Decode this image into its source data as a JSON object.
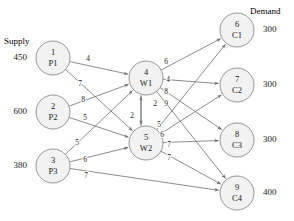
{
  "headings": {
    "supply": "Supply",
    "demand": "Demand"
  },
  "chart_data": {
    "type": "diagram",
    "title": "",
    "subtitle": "",
    "diagram_kind": "transshipment-network",
    "layers": [
      "supply",
      "transshipment",
      "demand"
    ],
    "nodes": [
      {
        "id": 1,
        "index": "1",
        "name": "P1",
        "layer": "supply",
        "x": 53,
        "y": 58,
        "r": 17,
        "value": "450",
        "value_kind": "supply"
      },
      {
        "id": 2,
        "index": "2",
        "name": "P2",
        "layer": "supply",
        "x": 53,
        "y": 112,
        "r": 17,
        "value": "600",
        "value_kind": "supply"
      },
      {
        "id": 3,
        "index": "3",
        "name": "P3",
        "layer": "supply",
        "x": 53,
        "y": 166,
        "r": 17,
        "value": "380",
        "value_kind": "supply"
      },
      {
        "id": 4,
        "index": "4",
        "name": "W1",
        "layer": "transshipment",
        "x": 146,
        "y": 78,
        "r": 17,
        "value": "",
        "value_kind": ""
      },
      {
        "id": 5,
        "index": "5",
        "name": "W2",
        "layer": "transshipment",
        "x": 146,
        "y": 143,
        "r": 17,
        "value": "",
        "value_kind": ""
      },
      {
        "id": 6,
        "index": "6",
        "name": "C1",
        "layer": "demand",
        "x": 237,
        "y": 30,
        "r": 17,
        "value": "300",
        "value_kind": "demand"
      },
      {
        "id": 7,
        "index": "7",
        "name": "C2",
        "layer": "demand",
        "x": 237,
        "y": 85,
        "r": 17,
        "value": "300",
        "value_kind": "demand"
      },
      {
        "id": 8,
        "index": "8",
        "name": "C3",
        "layer": "demand",
        "x": 237,
        "y": 140,
        "r": 17,
        "value": "300",
        "value_kind": "demand"
      },
      {
        "id": 9,
        "index": "9",
        "name": "C4",
        "layer": "demand",
        "x": 237,
        "y": 193,
        "r": 17,
        "value": "400",
        "value_kind": "demand"
      }
    ],
    "edges": [
      {
        "from": 1,
        "to": 4,
        "cost": "4",
        "lx": 88,
        "ly": 59
      },
      {
        "from": 1,
        "to": 5,
        "cost": "7",
        "lx": 80,
        "ly": 84
      },
      {
        "from": 2,
        "to": 4,
        "cost": "8",
        "lx": 83,
        "ly": 100
      },
      {
        "from": 2,
        "to": 5,
        "cost": "5",
        "lx": 85,
        "ly": 118
      },
      {
        "from": 3,
        "to": 4,
        "cost": "5",
        "lx": 77,
        "ly": 143
      },
      {
        "from": 3,
        "to": 5,
        "cost": "6",
        "lx": 85,
        "ly": 160
      },
      {
        "from": 3,
        "to": 9,
        "cost": "7",
        "lx": 86,
        "ly": 176
      },
      {
        "from": 5,
        "to": 4,
        "cost": "2",
        "lx": 132,
        "ly": 116
      },
      {
        "from": 4,
        "to": 5,
        "cost": "2",
        "lx": 155,
        "ly": 104
      },
      {
        "from": 4,
        "to": 6,
        "cost": "6",
        "lx": 166,
        "ly": 62
      },
      {
        "from": 4,
        "to": 7,
        "cost": "4",
        "lx": 168,
        "ly": 80
      },
      {
        "from": 4,
        "to": 8,
        "cost": "8",
        "lx": 166,
        "ly": 92
      },
      {
        "from": 4,
        "to": 9,
        "cost": "9",
        "lx": 166,
        "ly": 104
      },
      {
        "from": 5,
        "to": 6,
        "cost": "5",
        "lx": 159,
        "ly": 125
      },
      {
        "from": 5,
        "to": 7,
        "cost": "6",
        "lx": 162,
        "ly": 135
      },
      {
        "from": 5,
        "to": 8,
        "cost": "7",
        "lx": 169,
        "ly": 145
      },
      {
        "from": 5,
        "to": 9,
        "cost": "7",
        "lx": 169,
        "ly": 158
      }
    ],
    "annotations": {
      "supply_header_pos": {
        "x": 4,
        "y": 44
      },
      "demand_header_pos": {
        "x": 253,
        "y": 14
      }
    },
    "colors": {
      "node_fill": "#f2f2f2",
      "node_stroke": "#8a8a8a",
      "edge_stroke": "#6f6f6f",
      "text": "#1a1a1a",
      "background": "#ffffff"
    }
  }
}
